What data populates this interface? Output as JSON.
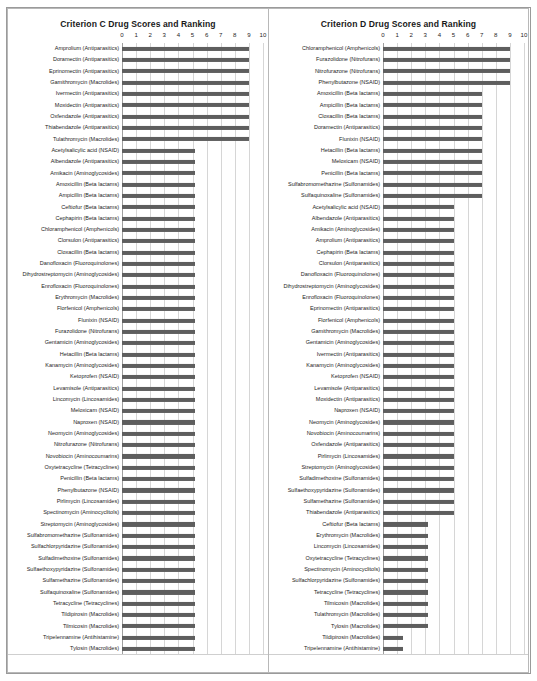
{
  "charts": [
    {
      "id": "criterion-c",
      "title": "Criterion C Drug Scores and Ranking",
      "chart_data": {
        "type": "bar",
        "title": "Criterion C Drug Scores and Ranking",
        "xlabel": "",
        "ylabel": "",
        "xlim": [
          0,
          10
        ],
        "orientation": "horizontal",
        "grid": true,
        "legend": "none",
        "ticks": [
          "0",
          "1",
          "2",
          "3",
          "4",
          "5",
          "6",
          "7",
          "8",
          "9",
          "10"
        ],
        "categories": [
          "Amprolium (Antiparasitics)",
          "Doramectin (Antiparasitics)",
          "Eprinomectin (Antiparasitics)",
          "Gamithromycin (Macrolides)",
          "Ivermectin (Antiparasitics)",
          "Moxidectin (Antiparasitics)",
          "Oxfendazole (Antiparasitics)",
          "Thiabendazole (Antiparasitics)",
          "Tulathromycin (Macrolides)",
          "Acetylsalicylic acid (NSAID)",
          "Albendazole (Antiparasitics)",
          "Amikacin (Aminoglycosides)",
          "Amoxicillin (Beta lactams)",
          "Ampicillin (Beta lactams)",
          "Ceftiofur (Beta lactams)",
          "Cephapirin (Beta lactams)",
          "Chloramphenicol (Amphenicols)",
          "Clorsulon (Antiparasitics)",
          "Cloxacillin (Beta lactams)",
          "Danofloxacin (Fluoroquinolones)",
          "Dihydrostreptomycin (Aminoglycosides)",
          "Enrofloxacin (Fluoroquinolones)",
          "Erythromycin (Macrolides)",
          "Florfenicol (Amphenicols)",
          "Flunixin (NSAID)",
          "Furazolidone (Nitrofurans)",
          "Gentamicin (Aminoglycosides)",
          "Hetacillin (Beta lactams)",
          "Kanamycin (Aminoglycosides)",
          "Ketoprofen (NSAID)",
          "Levamisole (Antiparasitics)",
          "Lincomycin (Lincosamides)",
          "Meloxicam (NSAID)",
          "Naproxen (NSAID)",
          "Neomycin (Aminoglycosides)",
          "Nitrofurazone (Nitrofurans)",
          "Novobiocin (Aminocoumarins)",
          "Oxytetracycline (Tetracyclines)",
          "Penicillin (Beta lactams)",
          "Phenylbutazone (NSAID)",
          "Pirlimycin (Lincosamides)",
          "Spectinomycin (Aminocyclitols)",
          "Streptomycin (Aminoglycosides)",
          "Sulfabromomethazine (Sulfonamides)",
          "Sulfachlorpyridazine (Sulfonamides)",
          "Sulfadimethoxine (Sulfonamides)",
          "Sulfaethoxypyridazine (Sulfonamides)",
          "Sulfamethazine (Sulfonamides)",
          "Sulfaquinoxaline (Sulfonamides)",
          "Tetracycline (Tetracyclines)",
          "Tildipirosin (Macrolides)",
          "Tilmicosin (Macrolides)",
          "Tripelennamine (Antihistamine)",
          "Tylosin (Macrolides)"
        ],
        "values": [
          9,
          9,
          9,
          9,
          9,
          9,
          9,
          9,
          9,
          5.2,
          5.2,
          5.2,
          5.2,
          5.2,
          5.2,
          5.2,
          5.2,
          5.2,
          5.2,
          5.2,
          5.2,
          5.2,
          5.2,
          5.2,
          5.2,
          5.2,
          5.2,
          5.2,
          5.2,
          5.2,
          5.2,
          5.2,
          5.2,
          5.2,
          5.2,
          5.2,
          5.2,
          5.2,
          5.2,
          5.2,
          5.2,
          5.2,
          5.2,
          5.2,
          5.2,
          5.2,
          5.2,
          5.2,
          5.2,
          5.2,
          5.2,
          5.2,
          5.2,
          5.2
        ]
      }
    },
    {
      "id": "criterion-d",
      "title": "Criterion D Drug Scores and Ranking",
      "chart_data": {
        "type": "bar",
        "title": "Criterion D Drug Scores and Ranking",
        "xlabel": "",
        "ylabel": "",
        "xlim": [
          0,
          10
        ],
        "orientation": "horizontal",
        "grid": true,
        "legend": "none",
        "ticks": [
          "0",
          "1",
          "2",
          "3",
          "4",
          "5",
          "6",
          "7",
          "8",
          "9",
          "10"
        ],
        "categories": [
          "Chloramphenicol (Amphenicols)",
          "Furazolidone (Nitrofurans)",
          "Nitrofurazone (Nitrofurans)",
          "Phenylbutazone (NSAID)",
          "Amoxicillin (Beta lactams)",
          "Ampicillin (Beta lactams)",
          "Cloxacillin (Beta lactams)",
          "Doramectin (Antiparasitics)",
          "Flunixin (NSAID)",
          "Hetacillin (Beta lactams)",
          "Meloxicam (NSAID)",
          "Penicillin (Beta lactams)",
          "Sulfabromomethazine (Sulfonamides)",
          "Sulfaquinoxaline (Sulfonamides)",
          "Acetylsalicylic acid (NSAID)",
          "Albendazole (Antiparasitics)",
          "Amikacin (Aminoglycosides)",
          "Amprolium (Antiparasitics)",
          "Cephapirin (Beta lactams)",
          "Clorsulon (Antiparasitics)",
          "Danofloxacin (Fluoroquinolones)",
          "Dihydrostreptomycin (Aminoglycosides)",
          "Enrofloxacin (Fluoroquinolones)",
          "Eprinomectin (Antiparasitics)",
          "Florfenicol (Amphenicols)",
          "Gamithromycin (Macrolides)",
          "Gentamicin (Aminoglycosides)",
          "Ivermectin (Antiparasitics)",
          "Kanamycin (Aminoglycosides)",
          "Ketoprofen (NSAID)",
          "Levamisole (Antiparasitics)",
          "Moxidectin (Antiparasitics)",
          "Naproxen (NSAID)",
          "Neomycin (Aminoglycosides)",
          "Novobiocin (Aminocoumarins)",
          "Oxfendazole (Antiparasitics)",
          "Pirlimycin (Lincosamides)",
          "Streptomycin (Aminoglycosides)",
          "Sulfadimethoxine (Sulfonamides)",
          "Sulfaethoxypyridazine (Sulfonamides)",
          "Sulfamethazine (Sulfonamides)",
          "Thiabendazole (Antiparasitics)",
          "Ceftiofur (Beta lactams)",
          "Erythromycin (Macrolides)",
          "Lincomycin (Lincosamides)",
          "Oxytetracycline (Tetracyclines)",
          "Spectinomycin (Aminocyclitols)",
          "Sulfachlorpyridazine (Sulfonamides)",
          "Tetracycline (Tetracyclines)",
          "Tilmicosin (Macrolides)",
          "Tulathromycin (Macrolides)",
          "Tylosin (Macrolides)",
          "Tildipirosin (Macrolides)",
          "Tripelennamine (Antihistamine)"
        ],
        "values": [
          9,
          9,
          9,
          9,
          7,
          7,
          7,
          7,
          7,
          7,
          7,
          7,
          7,
          7,
          5,
          5,
          5,
          5,
          5,
          5,
          5,
          5,
          5,
          5,
          5,
          5,
          5,
          5,
          5,
          5,
          5,
          5,
          5,
          5,
          5,
          5,
          5,
          5,
          5,
          5,
          5,
          5,
          3.2,
          3.2,
          3.2,
          3.2,
          3.2,
          3.2,
          3.2,
          3.2,
          3.2,
          3.2,
          1.4,
          1.4
        ]
      }
    }
  ],
  "style": {
    "bar_color": "#5e5e5e",
    "grid_color": "#d6d6d6",
    "text_color": "#1d1d1d"
  }
}
